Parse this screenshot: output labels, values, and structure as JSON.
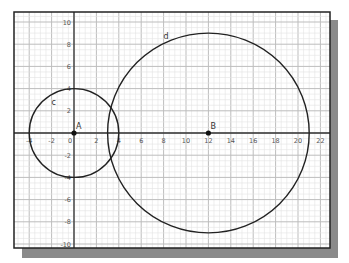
{
  "chart_data": {
    "type": "geometry",
    "title": "",
    "xlabel": "",
    "ylabel": "",
    "xlim": [
      -5,
      23
    ],
    "ylim": [
      -10.5,
      10.5
    ],
    "grid": true,
    "x_ticks": [
      -4,
      -2,
      0,
      2,
      4,
      6,
      8,
      10,
      12,
      14,
      16,
      18,
      20,
      22
    ],
    "y_ticks": [
      -10,
      -8,
      -6,
      -4,
      -2,
      2,
      4,
      6,
      8,
      10
    ],
    "points": [
      {
        "name": "A",
        "x": 0,
        "y": 0
      },
      {
        "name": "B",
        "x": 12,
        "y": 0
      }
    ],
    "circles": [
      {
        "name": "c",
        "center": "A",
        "cx": 0,
        "cy": 0,
        "r": 4,
        "label_x": -2,
        "label_y": 2.5
      },
      {
        "name": "d",
        "center": "B",
        "cx": 12,
        "cy": 0,
        "r": 9,
        "label_x": 8,
        "label_y": 8.5
      }
    ]
  },
  "style": {
    "frame_color": "#222222",
    "shadow_color": "#888888",
    "grid_major_color": "#bdbdbd",
    "grid_minor_color": "#e2e2e2",
    "axis_color": "#333333",
    "curve_color": "#222222",
    "tick_label_color": "#555555"
  }
}
